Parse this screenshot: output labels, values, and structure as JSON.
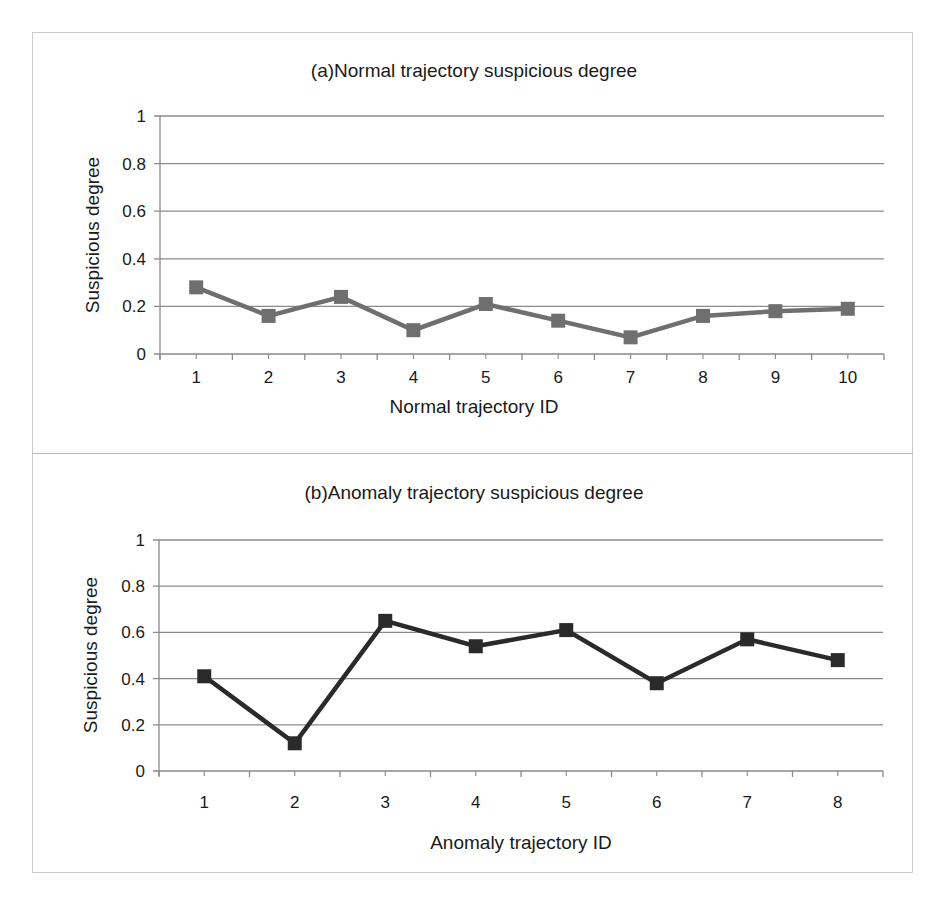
{
  "chart_data": [
    {
      "type": "line",
      "title": "(a)Normal trajectory suspicious degree",
      "xlabel": "Normal trajectory ID",
      "ylabel": "Suspicious degree",
      "categories": [
        "1",
        "2",
        "3",
        "4",
        "5",
        "6",
        "7",
        "8",
        "9",
        "10"
      ],
      "series": [
        {
          "name": "Normal trajectory",
          "values": [
            0.28,
            0.16,
            0.24,
            0.1,
            0.21,
            0.14,
            0.07,
            0.16,
            0.18,
            0.19
          ],
          "color": "#6f6f6f",
          "marker": "square"
        }
      ],
      "ylim": [
        0,
        1
      ],
      "yticks": [
        "0",
        "0.2",
        "0.4",
        "0.6",
        "0.8",
        "1"
      ],
      "grid": true,
      "legend": "none"
    },
    {
      "type": "line",
      "title": "(b)Anomaly trajectory suspicious degree",
      "xlabel": "Anomaly trajectory ID",
      "ylabel": "Suspicious degree",
      "categories": [
        "1",
        "2",
        "3",
        "4",
        "5",
        "6",
        "7",
        "8"
      ],
      "series": [
        {
          "name": "Anomaly trajectory",
          "values": [
            0.41,
            0.12,
            0.65,
            0.54,
            0.61,
            0.38,
            0.57,
            0.48
          ],
          "color": "#2a2a2a",
          "marker": "square"
        }
      ],
      "ylim": [
        0,
        1
      ],
      "yticks": [
        "0",
        "0.2",
        "0.4",
        "0.6",
        "0.8",
        "1"
      ],
      "grid": true,
      "legend": "none"
    }
  ]
}
